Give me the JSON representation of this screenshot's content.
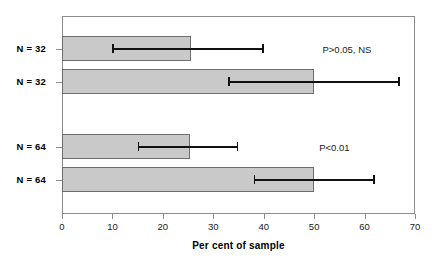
{
  "chart_data": {
    "type": "bar",
    "orientation": "horizontal",
    "title": "",
    "xlabel": "Per cent of sample",
    "ylabel": "",
    "xlim": [
      0,
      70
    ],
    "xticks": [
      0,
      10,
      20,
      30,
      40,
      50,
      60,
      70
    ],
    "xticklabels": [
      "0",
      "10",
      "20",
      "30",
      "40",
      "50",
      "60",
      "70"
    ],
    "grid": false,
    "legend": null,
    "categories": [
      "N = 32",
      "N = 32",
      "N = 64",
      "N = 64"
    ],
    "values": [
      25.5,
      50.0,
      25.3,
      50.0
    ],
    "error_low": [
      10.0,
      33.0,
      15.0,
      38.0
    ],
    "error_high": [
      40.0,
      67.0,
      35.0,
      62.0
    ],
    "series": [
      {
        "name": "Per cent of sample",
        "values": [
          25.5,
          50.0,
          25.3,
          50.0
        ]
      }
    ],
    "bars": [
      {
        "label": "N = 32",
        "value": 25.5,
        "err_low": 10.0,
        "err_high": 40.0
      },
      {
        "label": "N = 32",
        "value": 50.0,
        "err_low": 33.0,
        "err_high": 67.0
      },
      {
        "label": "N = 64",
        "value": 25.3,
        "err_low": 15.0,
        "err_high": 35.0
      },
      {
        "label": "N = 64",
        "value": 50.0,
        "err_low": 38.0,
        "err_high": 62.0
      }
    ],
    "annotations": [
      {
        "text": "P>0.05, NS",
        "x": 56.5,
        "group": "top"
      },
      {
        "text": "P<0.01",
        "x": 54.0,
        "group": "bottom"
      }
    ],
    "colors": {
      "bar_fill": "#c9c9c9",
      "bar_edge": "#6e6e6e",
      "error_bar": "#111111",
      "axis": "#8c8c8c",
      "text": "#1a1a1a",
      "background": "#ffffff"
    }
  },
  "axis": {
    "x_title": "Per cent of sample"
  }
}
